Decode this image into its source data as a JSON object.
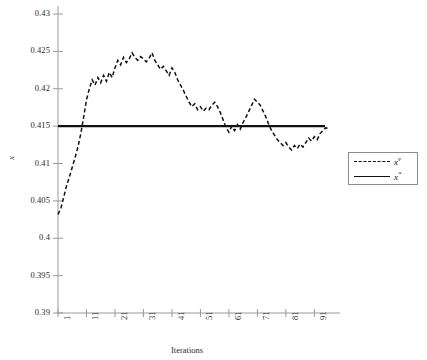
{
  "chart_data": {
    "type": "line",
    "title": "",
    "xlabel": "Iterations",
    "ylabel": "x",
    "xlim": [
      1,
      100
    ],
    "ylim": [
      0.39,
      0.43
    ],
    "grid": false,
    "legend_position": "right",
    "y_ticks": [
      "0.39",
      "0.395",
      "0.4",
      "0.405",
      "0.41",
      "0.415",
      "0.42",
      "0.425",
      "0.43"
    ],
    "y_tick_values": [
      0.39,
      0.395,
      0.4,
      0.405,
      0.41,
      0.415,
      0.42,
      0.425,
      0.43
    ],
    "x_ticks": [
      "1",
      "11",
      "21",
      "31",
      "41",
      "51",
      "61",
      "71",
      "81",
      "91"
    ],
    "x_tick_values": [
      1,
      11,
      21,
      31,
      41,
      51,
      61,
      71,
      81,
      91
    ],
    "series": [
      {
        "name": "x^v",
        "label_base": "x",
        "label_sup": "v",
        "style": "dashed",
        "color": "#111111",
        "x": [
          1,
          2,
          3,
          4,
          5,
          6,
          7,
          8,
          9,
          10,
          11,
          12,
          13,
          14,
          15,
          16,
          17,
          18,
          19,
          20,
          21,
          22,
          23,
          24,
          25,
          26,
          27,
          28,
          29,
          30,
          31,
          32,
          33,
          34,
          35,
          36,
          37,
          38,
          39,
          40,
          41,
          42,
          43,
          44,
          45,
          46,
          47,
          48,
          49,
          50,
          51,
          52,
          53,
          54,
          55,
          56,
          57,
          58,
          59,
          60,
          61,
          62,
          63,
          64,
          65,
          66,
          67,
          68,
          69,
          70,
          71,
          72,
          73,
          74,
          75,
          76,
          77,
          78,
          79,
          80,
          81,
          82,
          83,
          84,
          85,
          86,
          87,
          88,
          89,
          90,
          91,
          92,
          93,
          94,
          95,
          96
        ],
        "values": [
          0.4032,
          0.404,
          0.4055,
          0.407,
          0.4082,
          0.4095,
          0.4108,
          0.4122,
          0.414,
          0.4162,
          0.4185,
          0.42,
          0.4212,
          0.4205,
          0.4215,
          0.4208,
          0.4218,
          0.421,
          0.4222,
          0.4215,
          0.4228,
          0.4238,
          0.4232,
          0.4242,
          0.4235,
          0.424,
          0.4248,
          0.4242,
          0.4238,
          0.4243,
          0.424,
          0.4236,
          0.4241,
          0.4248,
          0.4238,
          0.4232,
          0.4226,
          0.423,
          0.4224,
          0.4218,
          0.4228,
          0.4222,
          0.4212,
          0.4205,
          0.4198,
          0.419,
          0.4182,
          0.4176,
          0.418,
          0.4172,
          0.4176,
          0.417,
          0.4174,
          0.4172,
          0.4178,
          0.4182,
          0.4176,
          0.4168,
          0.4158,
          0.4148,
          0.4142,
          0.415,
          0.4144,
          0.4152,
          0.4146,
          0.4155,
          0.4162,
          0.417,
          0.4178,
          0.4186,
          0.4182,
          0.4178,
          0.417,
          0.4162,
          0.4152,
          0.4144,
          0.4138,
          0.4132,
          0.4128,
          0.4124,
          0.4128,
          0.4122,
          0.4118,
          0.4124,
          0.412,
          0.4126,
          0.4122,
          0.4128,
          0.4134,
          0.413,
          0.4136,
          0.4132,
          0.414,
          0.4144,
          0.4148,
          0.4146
        ]
      },
      {
        "name": "x^*",
        "label_base": "x",
        "label_sup": "*",
        "style": "solid",
        "color": "#111111",
        "constant_value": 0.415
      }
    ]
  },
  "axes": {
    "y_axis_name": "y-axis",
    "x_axis_name": "x-axis"
  },
  "legend": {
    "entries": [
      {
        "label_base": "x",
        "label_sup": "v",
        "style": "dashed"
      },
      {
        "label_base": "x",
        "label_sup": "*",
        "style": "solid"
      }
    ]
  }
}
